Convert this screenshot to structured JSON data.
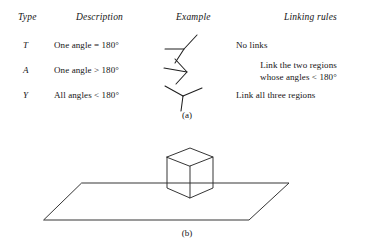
{
  "figure": {
    "panel_a": {
      "caption": "(a)",
      "columns": [
        {
          "label": "Type"
        },
        {
          "label": "Description"
        },
        {
          "label": "Example"
        },
        {
          "label": "Linking rules"
        }
      ],
      "rows": [
        {
          "type": "T",
          "description": "One angle = 180°",
          "example_icon": "t-junction-icon",
          "rule_line1": "No links",
          "rule_line2": ""
        },
        {
          "type": "A",
          "description": "One angle  > 180°",
          "example_icon": "arrow-junction-icon",
          "rule_line1": "Link the two regions",
          "rule_line2": "whose angles  < 180°"
        },
        {
          "type": "Y",
          "description": "All angles < 180°",
          "example_icon": "y-junction-icon",
          "rule_line1": "Link all three regions",
          "rule_line2": ""
        }
      ]
    },
    "panel_b": {
      "caption": "(b)",
      "scene_icon": "cube-on-ground-plane-icon"
    }
  }
}
